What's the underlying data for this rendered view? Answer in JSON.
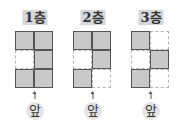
{
  "floors": [
    {
      "label": "1층",
      "front_label": "앞",
      "grid": [
        [
          1,
          1
        ],
        [
          0,
          1
        ],
        [
          1,
          1
        ]
      ]
    },
    {
      "label": "2층",
      "front_label": "앞",
      "grid": [
        [
          1,
          1
        ],
        [
          0,
          1
        ],
        [
          1,
          0
        ]
      ]
    },
    {
      "label": "3층",
      "front_label": "앞",
      "grid": [
        [
          1,
          0
        ],
        [
          0,
          1
        ],
        [
          1,
          0
        ]
      ]
    }
  ],
  "colors": {
    "filled": "#c9c9c9",
    "border": "#555555",
    "title_bg": "#d6d6d6"
  }
}
